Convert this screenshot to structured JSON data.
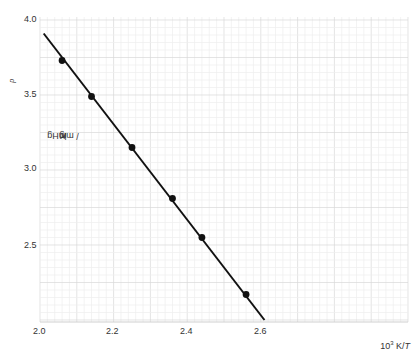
{
  "chart_data": {
    "type": "scatter",
    "title": "",
    "xlabel": "10³ K/T",
    "ylabel": "lg Kp / mmHg",
    "xlim": [
      2.0,
      2.8
    ],
    "ylim": [
      2.0,
      4.0
    ],
    "x_ticks": [
      "2.0",
      "2.2",
      "2.4",
      "2.6"
    ],
    "y_ticks": [
      "4.0",
      "3.5",
      "3.0",
      "2.5",
      "2.0"
    ],
    "grid": true,
    "legend": null,
    "series": [
      {
        "name": "measured",
        "marker": "filled-circle",
        "x": [
          2.06,
          2.14,
          2.25,
          2.36,
          2.44,
          2.56
        ],
        "y": [
          3.73,
          3.49,
          3.15,
          2.81,
          2.55,
          2.17
        ]
      }
    ],
    "fit_line": {
      "x": [
        2.01,
        2.61
      ],
      "y": [
        3.91,
        2.0
      ]
    }
  },
  "labels": {
    "ylabel_main": "lg ",
    "ylabel_symbol": "K",
    "ylabel_sub": "p",
    "ylabel_unit": " / mmHg",
    "xlabel": "10³ K/T",
    "xticks": [
      "2.0",
      "2.2",
      "2.4",
      "2.6"
    ],
    "yticks": [
      "4.0",
      "3.5",
      "3.0",
      "2.5"
    ]
  }
}
